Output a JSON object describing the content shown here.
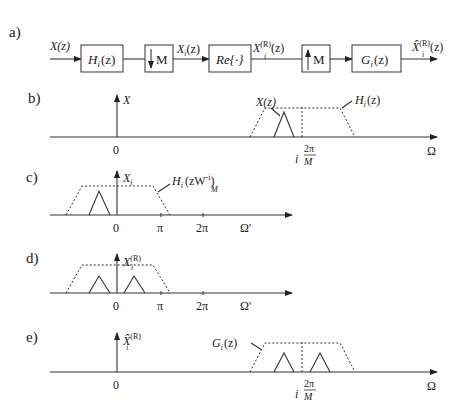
{
  "panels": {
    "a": {
      "label": "a)",
      "input_signal": "X(z)",
      "blocks": [
        {
          "id": "analysis-filter",
          "text": "H",
          "sub": "i",
          "arg": "(z)"
        },
        {
          "id": "downsampler",
          "text": "M",
          "direction": "down"
        },
        {
          "id": "real-part",
          "text": "Re{·}"
        },
        {
          "id": "upsampler",
          "text": "M",
          "direction": "up"
        },
        {
          "id": "synthesis-filter",
          "text": "G",
          "sub": "i",
          "arg": "(z)"
        }
      ],
      "signals": {
        "after_down": {
          "main": "X",
          "sub": "i",
          "arg": "(z)"
        },
        "after_re": {
          "main": "X",
          "sup": "(R)",
          "sub": "i",
          "arg": "(z)"
        },
        "output": {
          "main": "X̂",
          "sup": "(R)",
          "sub": "i",
          "arg": "(z)"
        }
      }
    },
    "b": {
      "label": "b)",
      "y_label": "X",
      "origin": "0",
      "x_label": "Ω",
      "marker": {
        "prefix": "i",
        "num": "2π",
        "den": "M"
      },
      "annotations": {
        "signal": "X(z)",
        "filter": {
          "main": "H",
          "sub": "i",
          "arg": "(z)"
        }
      }
    },
    "c": {
      "label": "c)",
      "y_label": {
        "main": "X",
        "sub": "i"
      },
      "origin": "0",
      "ticks": [
        "π",
        "2π"
      ],
      "x_label": "Ω'",
      "annotation": {
        "main": "H",
        "sub": "i",
        "arg_open": "(zW",
        "w_sub": "M",
        "w_sup": "-i",
        "arg_close": ")"
      }
    },
    "d": {
      "label": "d)",
      "y_label": {
        "main": "X",
        "sub": "i",
        "sup": "(R)"
      },
      "origin": "0",
      "ticks": [
        "π",
        "2π"
      ],
      "x_label": "Ω'"
    },
    "e": {
      "label": "e)",
      "y_label": {
        "main": "X̂",
        "sub": "i",
        "sup": "(R)"
      },
      "origin": "0",
      "x_label": "Ω",
      "marker": {
        "prefix": "i",
        "num": "2π",
        "den": "M"
      },
      "annotation": {
        "main": "G",
        "sub": "i",
        "arg": "(z)"
      }
    }
  }
}
